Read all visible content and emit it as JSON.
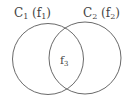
{
  "diagram": {
    "type": "venn",
    "colors": {
      "stroke": "#6a6a6a",
      "text": "#444444",
      "background": "#ffffff"
    },
    "sets": [
      {
        "id": "C1",
        "label_main": "C",
        "label_sub": "1",
        "paren_main": "f",
        "paren_sub": "1"
      },
      {
        "id": "C2",
        "label_main": "C",
        "label_sub": "2",
        "paren_main": "f",
        "paren_sub": "2"
      }
    ],
    "intersection": {
      "label_main": "f",
      "label_sub": "3"
    }
  }
}
